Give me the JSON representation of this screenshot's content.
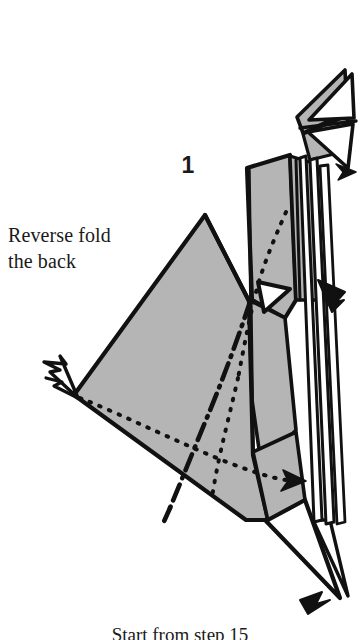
{
  "page": {
    "background_color": "#ffffff",
    "width": 360,
    "height": 640
  },
  "diagram": {
    "step_number": "1",
    "instruction_line_1": "Reverse fold",
    "instruction_line_2": "the back",
    "footer_text": "Start from step 15",
    "paper_front_color": "#b5b5b5",
    "paper_back_color": "#ffffff",
    "line_color": "#111111",
    "legend": {
      "solid_line": "edge",
      "dotted_line": "hidden edge",
      "dash_dot_line": "mountain fold",
      "hollow_arrow": "reverse fold direction",
      "solid_arrow": "fold motion direction"
    }
  }
}
